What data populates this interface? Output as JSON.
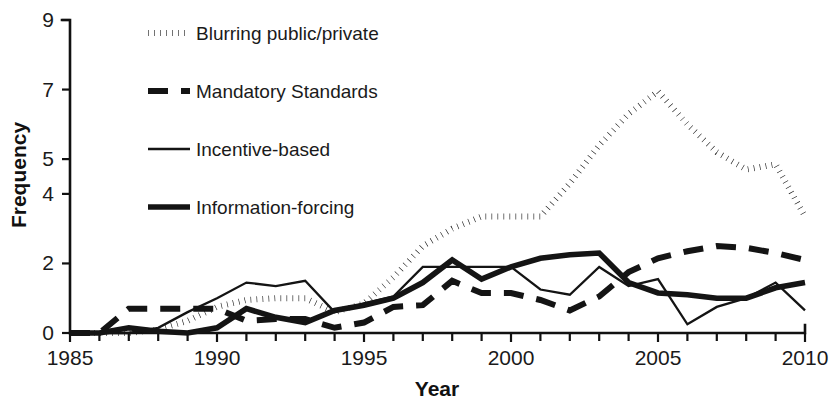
{
  "chart_data": {
    "type": "line",
    "title": "",
    "xlabel": "Year",
    "ylabel": "Frequency",
    "xlim": [
      1985,
      2010
    ],
    "ylim": [
      0,
      9
    ],
    "grid": false,
    "legend_position": "upper-left-inside",
    "x_tick_labels": [
      "1985",
      "1990",
      "1995",
      "2000",
      "2005",
      "2010"
    ],
    "x_tick_values": [
      1985,
      1990,
      1995,
      2000,
      2005,
      2010
    ],
    "x_minor_tick_interval": 1,
    "y_tick_labels": [
      "0",
      "2",
      "4",
      "5",
      "7",
      "9"
    ],
    "y_tick_values": [
      0,
      2,
      4,
      5,
      7,
      9
    ],
    "x": [
      1985,
      1986,
      1987,
      1988,
      1989,
      1990,
      1991,
      1992,
      1993,
      1994,
      1995,
      1996,
      1997,
      1998,
      1999,
      2000,
      2001,
      2002,
      2003,
      2004,
      2005,
      2006,
      2007,
      2008,
      2009,
      2010
    ],
    "series": [
      {
        "name": "Blurring public/private",
        "style": "dotted",
        "color": "#141414",
        "values": [
          0,
          0,
          0,
          0.1,
          0.35,
          0.75,
          0.95,
          1.0,
          1.0,
          0.6,
          0.85,
          1.6,
          2.5,
          3.0,
          3.35,
          3.35,
          3.35,
          4.3,
          5.4,
          6.3,
          6.95,
          6.0,
          5.2,
          4.7,
          4.85,
          3.35
        ]
      },
      {
        "name": "Mandatory Standards",
        "style": "dashed",
        "color": "#141414",
        "values": [
          0,
          0,
          0.7,
          0.7,
          0.7,
          0.7,
          0.35,
          0.4,
          0.4,
          0.15,
          0.3,
          0.75,
          0.8,
          1.5,
          1.15,
          1.15,
          0.95,
          0.65,
          1.05,
          1.75,
          2.15,
          2.35,
          2.5,
          2.45,
          2.3,
          2.1
        ]
      },
      {
        "name": "Incentive-based",
        "style": "thin-solid",
        "color": "#141414",
        "values": [
          0,
          0,
          0,
          0.15,
          0.6,
          1.0,
          1.45,
          1.35,
          1.5,
          0.6,
          0.85,
          1.05,
          1.9,
          1.9,
          1.9,
          1.9,
          1.25,
          1.1,
          1.9,
          1.35,
          1.55,
          0.25,
          0.75,
          1.0,
          1.45,
          0.65
        ]
      },
      {
        "name": "Information-forcing",
        "style": "thick-solid",
        "color": "#141414",
        "values": [
          0,
          0,
          0.15,
          0.05,
          0.0,
          0.15,
          0.7,
          0.45,
          0.3,
          0.65,
          0.8,
          1.0,
          1.45,
          2.1,
          1.55,
          1.9,
          2.15,
          2.25,
          2.3,
          1.45,
          1.15,
          1.1,
          1.0,
          1.0,
          1.3,
          1.45
        ]
      }
    ]
  },
  "legend": {
    "items": [
      {
        "label": "Blurring public/private",
        "style": "dotted"
      },
      {
        "label": "Mandatory Standards",
        "style": "dashed"
      },
      {
        "label": "Incentive-based",
        "style": "thin-solid"
      },
      {
        "label": "Information-forcing",
        "style": "thick-solid"
      }
    ]
  }
}
